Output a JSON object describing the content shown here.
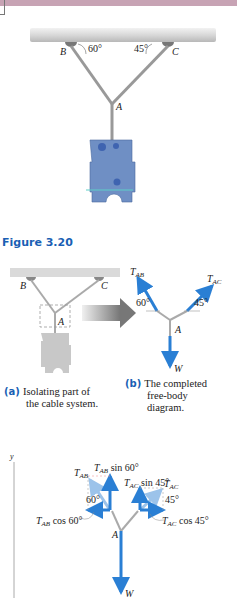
{
  "figure": {
    "number_label": "Figure 3.20",
    "top_diagram": {
      "points": [
        "B",
        "C",
        "A"
      ],
      "angles": [
        "60°",
        "45°"
      ]
    },
    "panel_a": {
      "tag": "(a)",
      "caption_line1": "Isolating part of",
      "caption_line2": "the cable system.",
      "points": [
        "B",
        "C",
        "A"
      ]
    },
    "panel_b": {
      "tag": "(b)",
      "caption_line1": "The completed",
      "caption_line2": "free-body",
      "caption_line3": "diagram.",
      "forces": [
        "T_AB",
        "T_AC",
        "W"
      ],
      "angles": [
        "60°",
        "45°"
      ],
      "point": "A"
    },
    "components_diagram": {
      "axis_label": "y",
      "labels": {
        "tab": "T_AB",
        "tab_sin": "T_AB sin 60°",
        "tac_sin": "T_AC sin 45°",
        "tac": "T_AC",
        "angle_ab": "60°",
        "angle_ac": "45°",
        "tab_cos": "T_AB cos 60°",
        "tac_cos": "T_AC cos 45°",
        "point": "A",
        "weight": "W"
      }
    },
    "colors": {
      "force_blue": "#2a7fd4",
      "light_blue": "#9cc3ea",
      "caption_blue": "#1a5fb4",
      "top_band": "#c7a3b4",
      "plate_blue": "#6f8fc4"
    }
  }
}
